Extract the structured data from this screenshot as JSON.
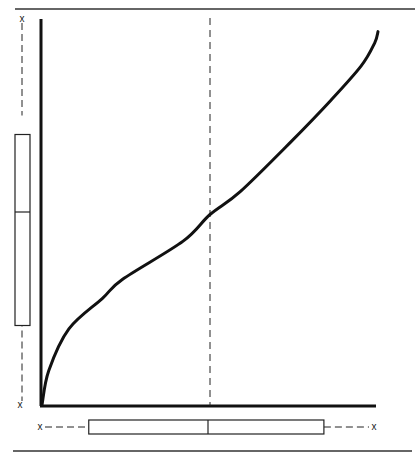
{
  "chart_data": {
    "type": "line",
    "title": "",
    "subtitle": "",
    "xlabel": "",
    "ylabel": "",
    "grid": false,
    "legend": null,
    "axes": {
      "x_ticks": [],
      "y_ticks": []
    },
    "xlim": [
      0,
      1
    ],
    "ylim": [
      0,
      1
    ],
    "series": [
      {
        "name": "curve",
        "x": [
          0.0,
          0.02,
          0.08,
          0.18,
          0.24,
          0.42,
          0.5,
          0.59,
          0.74,
          0.86,
          0.95,
          0.99,
          1.0
        ],
        "y": [
          0.0,
          0.09,
          0.2,
          0.28,
          0.33,
          0.43,
          0.5,
          0.56,
          0.69,
          0.8,
          0.89,
          0.95,
          0.98
        ]
      }
    ],
    "reference_lines": [
      {
        "orientation": "vertical",
        "x": 0.5,
        "style": "dashed",
        "label": "median x"
      }
    ],
    "marginal_boxplots": {
      "x": {
        "min": 0.0,
        "q1": 0.14,
        "median": 0.5,
        "q3": 0.85,
        "max": 1.0
      },
      "y": {
        "min": 0.0,
        "q1": 0.25,
        "median": 0.5,
        "q3": 0.75,
        "max": 1.0
      }
    }
  },
  "labels": {
    "whisker_marker": "x"
  }
}
